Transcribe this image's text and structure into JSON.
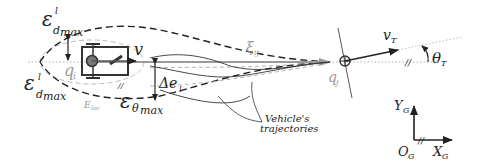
{
  "labels": {
    "eps_d_max_top": {
      "base": "ε",
      "sup": "l",
      "sub": "d",
      "subsub": "max"
    },
    "eps_d_max_bottom": {
      "base": "ε",
      "sup": "l",
      "sub": "d",
      "subsub": "max"
    },
    "eps_theta_max": {
      "base": "ε",
      "sub": "θ",
      "subsub": "max"
    },
    "e_loc": {
      "base": "E",
      "sub": "loc"
    },
    "q_i": {
      "base": "q",
      "sub": "i"
    },
    "q_j": {
      "base": "q",
      "sub": "j"
    },
    "v": "v",
    "xi_ij": {
      "base": "ξ",
      "sub": "ij"
    },
    "delta_e_l": {
      "base": "Δe",
      "sub": "l"
    },
    "trajectories_line1": "Vehicle's",
    "trajectories_line2": "trajectories",
    "v_T": {
      "base": "v",
      "sub": "T"
    },
    "theta_T": {
      "base": "θ",
      "sub": "T"
    },
    "Y_G": {
      "base": "Y",
      "sub": "G"
    },
    "X_G": {
      "base": "X",
      "sub": "G"
    },
    "O_G": {
      "base": "O",
      "sub": "G"
    },
    "parallel_mark": "//"
  },
  "colors": {
    "ink": "#222222",
    "gray": "#9a9a9a",
    "light_gray": "#bdbdbd"
  }
}
